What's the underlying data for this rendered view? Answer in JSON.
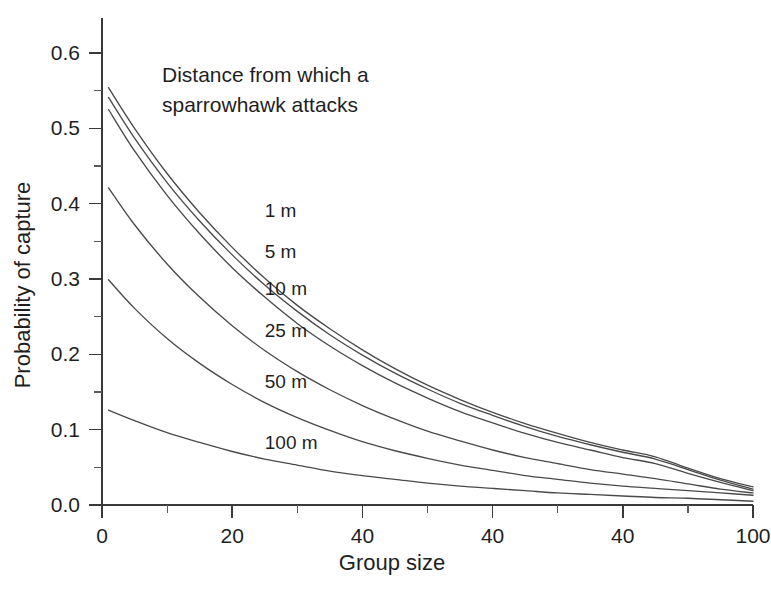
{
  "chart_data": {
    "type": "line",
    "title": "",
    "annotation": "Distance from which a sparrowhawk attacks",
    "annotation_lines": [
      "Distance from which a",
      "sparrowhawk attacks"
    ],
    "xlabel": "Group size",
    "ylabel": "Probability of capture",
    "xlim": [
      0,
      100
    ],
    "ylim": [
      0.0,
      0.65
    ],
    "grid": false,
    "legend_position": "inline-curve-labels",
    "x_tick_values": [
      0,
      20,
      40,
      60,
      80,
      100
    ],
    "x_tick_labels": [
      "0",
      "20",
      "40",
      "40",
      "40",
      "100"
    ],
    "x_minor_ticks": [
      10,
      30,
      50,
      70,
      90
    ],
    "y_tick_values": [
      0.0,
      0.1,
      0.2,
      0.3,
      0.4,
      0.5,
      0.6
    ],
    "y_tick_labels": [
      "0.0",
      "0.1",
      "0.2",
      "0.3",
      "0.4",
      "0.5",
      "0.6"
    ],
    "y_minor_ticks": [
      0.05,
      0.15,
      0.25,
      0.35,
      0.45,
      0.55,
      0.65
    ],
    "x": [
      1,
      5,
      10,
      15,
      20,
      25,
      30,
      35,
      40,
      45,
      50,
      55,
      60,
      65,
      70,
      75,
      80,
      85,
      90,
      95,
      100
    ],
    "series": [
      {
        "name": "1 m",
        "label": "1 m",
        "label_x": 25,
        "label_y": 0.392,
        "start_value": 0.554,
        "end_value": 0.024,
        "values": [
          0.554,
          0.5,
          0.44,
          0.388,
          0.342,
          0.301,
          0.265,
          0.234,
          0.206,
          0.181,
          0.159,
          0.14,
          0.123,
          0.108,
          0.095,
          0.083,
          0.073,
          0.064,
          0.049,
          0.035,
          0.024
        ]
      },
      {
        "name": "5 m",
        "label": "5 m",
        "label_x": 25,
        "label_y": 0.337,
        "start_value": 0.541,
        "end_value": 0.021,
        "values": [
          0.541,
          0.487,
          0.428,
          0.377,
          0.332,
          0.292,
          0.257,
          0.226,
          0.199,
          0.175,
          0.154,
          0.135,
          0.119,
          0.104,
          0.091,
          0.08,
          0.07,
          0.061,
          0.047,
          0.033,
          0.021
        ]
      },
      {
        "name": "10 m",
        "label": "10 m",
        "label_x": 25,
        "label_y": 0.288,
        "start_value": 0.525,
        "end_value": 0.019,
        "values": [
          0.525,
          0.47,
          0.411,
          0.36,
          0.315,
          0.276,
          0.241,
          0.211,
          0.185,
          0.162,
          0.142,
          0.124,
          0.109,
          0.095,
          0.083,
          0.073,
          0.063,
          0.055,
          0.042,
          0.03,
          0.019
        ]
      },
      {
        "name": "25 m",
        "label": "25 m",
        "label_x": 25,
        "label_y": 0.232,
        "start_value": 0.421,
        "end_value": 0.016,
        "values": [
          0.421,
          0.372,
          0.32,
          0.276,
          0.238,
          0.205,
          0.177,
          0.153,
          0.132,
          0.114,
          0.098,
          0.085,
          0.073,
          0.063,
          0.055,
          0.047,
          0.041,
          0.035,
          0.028,
          0.021,
          0.016
        ]
      },
      {
        "name": "50 m",
        "label": "50 m",
        "label_x": 25,
        "label_y": 0.164,
        "start_value": 0.299,
        "end_value": 0.013,
        "values": [
          0.299,
          0.261,
          0.221,
          0.188,
          0.16,
          0.136,
          0.116,
          0.099,
          0.084,
          0.072,
          0.062,
          0.053,
          0.046,
          0.039,
          0.034,
          0.029,
          0.025,
          0.022,
          0.019,
          0.016,
          0.013
        ]
      },
      {
        "name": "100 m",
        "label": "100 m",
        "label_x": 25,
        "label_y": 0.083,
        "start_value": 0.126,
        "end_value": 0.005,
        "values": [
          0.126,
          0.112,
          0.096,
          0.083,
          0.071,
          0.061,
          0.053,
          0.045,
          0.039,
          0.034,
          0.029,
          0.025,
          0.022,
          0.019,
          0.016,
          0.014,
          0.012,
          0.01,
          0.009,
          0.007,
          0.005
        ]
      }
    ]
  },
  "colors": {
    "background": "#ffffff",
    "curve": "#4a4a4a",
    "axis": "#3a3a3a",
    "text": "#1f1f1f"
  }
}
